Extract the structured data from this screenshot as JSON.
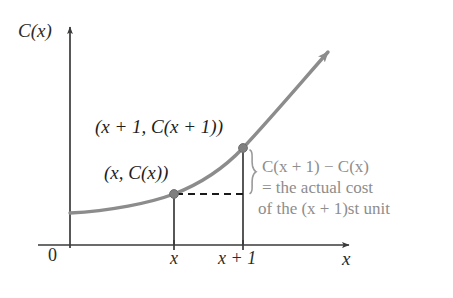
{
  "figure": {
    "kind": "math-diagram",
    "caption_topic": "Marginal cost vs actual cost of the (x + 1)st unit",
    "axes": {
      "y_axis_label": "C(x)",
      "x_axis_label": "x",
      "origin_label": "0"
    },
    "tick_labels": {
      "first": "x",
      "second": "x + 1"
    },
    "point_labels": {
      "upper": "(x + 1, C(x + 1))",
      "lower": "(x, C(x))"
    },
    "annotation": {
      "line1_prefix": "C(",
      "line1": "C(x + 1) − C(x)",
      "line2": "= the actual cost",
      "line3": "of the (x + 1)st unit"
    },
    "colors": {
      "curve": "#8c8c8c",
      "axis": "#3a3a3a",
      "point": "#808080",
      "dashed": "#1a1a1a",
      "brace": "#9a9a9a",
      "annotation_text": "#8d8d8d",
      "label_text": "#1d1d1d",
      "background": "#ffffff"
    },
    "geometry": {
      "x_axis_y": 245,
      "y_axis_x": 70,
      "y_axis_top": 22,
      "x_axis_right": 356,
      "point_x": 174,
      "point_x_plus_1": 243,
      "point_lower_y": 194,
      "point_upper_y": 148,
      "curve_start_y": 213,
      "curve_arrow_x": 331,
      "curve_arrow_y": 49
    }
  }
}
